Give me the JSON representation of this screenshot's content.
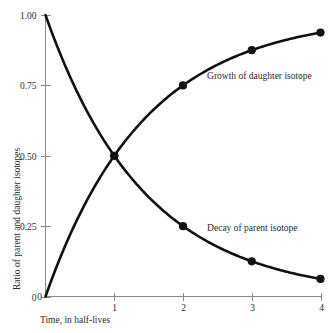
{
  "chart_data": {
    "type": "line",
    "title": "",
    "xlabel": "Time, in half-lives",
    "ylabel": "Ratio of parent and daughter isotopes",
    "xlim": [
      0,
      4
    ],
    "ylim": [
      0,
      1.0
    ],
    "grid": false,
    "legend_position": "inline-annotations",
    "xticks": [
      "0",
      "1",
      "2",
      "3",
      "4"
    ],
    "xtick_values": [
      0,
      1,
      2,
      3,
      4
    ],
    "yticks": [
      "0",
      "0.25",
      "0.50",
      "0.75",
      "1.00"
    ],
    "ytick_values": [
      0,
      0.25,
      0.5,
      0.75,
      1.0
    ],
    "series": [
      {
        "name": "Decay of parent isotope",
        "annotation": "Decay of parent isotope",
        "x": [
          0,
          1,
          2,
          3,
          4
        ],
        "values": [
          1.0,
          0.5,
          0.25,
          0.125,
          0.0625
        ],
        "marker_x": [
          1,
          2,
          3,
          4
        ],
        "marker_values": [
          0.5,
          0.25,
          0.125,
          0.0625
        ]
      },
      {
        "name": "Growth of daughter isotope",
        "annotation": "Growth of daughter isotope",
        "x": [
          0,
          1,
          2,
          3,
          4
        ],
        "values": [
          0.0,
          0.5,
          0.75,
          0.875,
          0.9375
        ],
        "marker_x": [
          1,
          2,
          3,
          4
        ],
        "marker_values": [
          0.5,
          0.75,
          0.875,
          0.9375
        ]
      }
    ],
    "annotations": [
      {
        "text": "Growth of daughter isotope",
        "x": 2.35,
        "y": 0.785
      },
      {
        "text": "Decay of parent isotope",
        "x": 2.35,
        "y": 0.245
      }
    ],
    "colors": {
      "curve": "#111111",
      "axis": "#8a8a8a",
      "text": "#2b2b2b",
      "background": "#ffffff"
    }
  }
}
